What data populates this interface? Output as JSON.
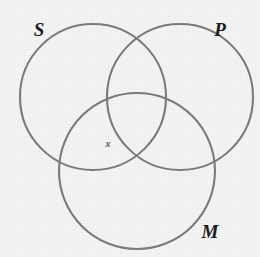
{
  "figure": {
    "kind": "venn-diagram",
    "background_color": "#f3f3f1",
    "stroke_color": "#7b7b7d",
    "label_color": "#1b1b1b",
    "width": 260,
    "height": 257
  },
  "circles": [
    {
      "id": "S",
      "cx": 93,
      "cy": 97,
      "r": 73
    },
    {
      "id": "P",
      "cx": 180,
      "cy": 97,
      "r": 73
    },
    {
      "id": "M",
      "cx": 137,
      "cy": 171,
      "r": 78
    }
  ],
  "labels": {
    "set_s": {
      "text": "S",
      "x": 39,
      "y": 36
    },
    "set_p": {
      "text": "P",
      "x": 220,
      "y": 36
    },
    "set_m": {
      "text": "M",
      "x": 210,
      "y": 238
    },
    "member_x": {
      "text": "x",
      "x": 108,
      "y": 147
    }
  }
}
